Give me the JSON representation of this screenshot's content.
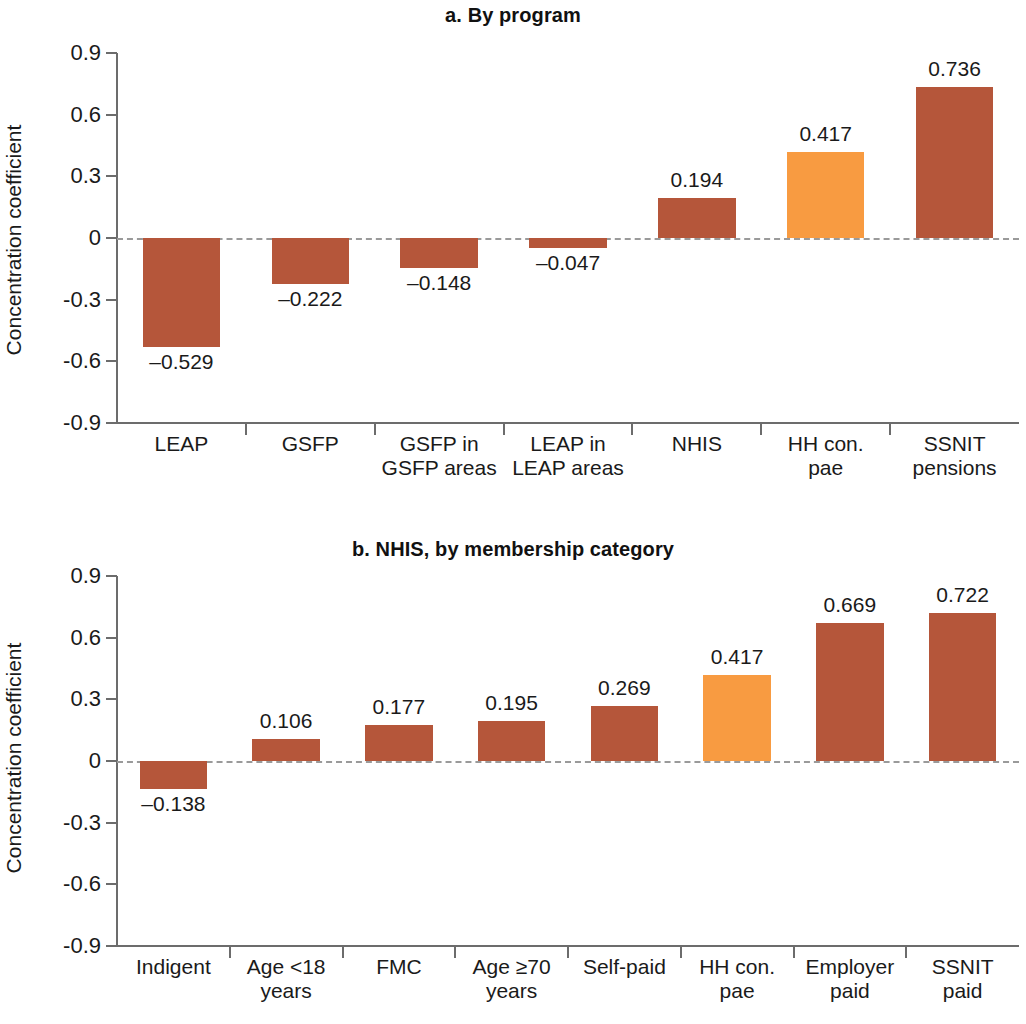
{
  "colors": {
    "bar_default": "#b5563a",
    "bar_highlight": "#f89b41",
    "axis": "#6c6c6c",
    "zero_line": "#9a9a9a",
    "text": "#1a1a1a"
  },
  "axis": {
    "y_label": "Concentration coefficient",
    "y_ticks": [
      "0.9",
      "0.6",
      "0.3",
      "0",
      "-0.3",
      "-0.6",
      "-0.9"
    ],
    "y_tick_values": [
      0.9,
      0.6,
      0.3,
      0,
      -0.3,
      -0.6,
      -0.9
    ],
    "y_min": -0.9,
    "y_max": 0.9
  },
  "chart_data": [
    {
      "type": "bar",
      "title": "a. By program",
      "xlabel": "",
      "ylabel": "Concentration coefficient",
      "ylim": [
        -0.9,
        0.9
      ],
      "yticks": [
        -0.9,
        -0.6,
        -0.3,
        0,
        0.3,
        0.6,
        0.9
      ],
      "grid": false,
      "legend": "none",
      "categories": [
        "LEAP",
        "GSFP",
        "GSFP in\nGSFP areas",
        "LEAP in\nLEAP areas",
        "NHIS",
        "HH con.\npae",
        "SSNIT\npensions"
      ],
      "values": [
        -0.529,
        -0.222,
        -0.148,
        -0.047,
        0.194,
        0.417,
        0.736
      ],
      "data_labels": [
        "–0.529",
        "–0.222",
        "–0.148",
        "–0.047",
        "0.194",
        "0.417",
        "0.736"
      ],
      "bar_colors": [
        "#b5563a",
        "#b5563a",
        "#b5563a",
        "#b5563a",
        "#b5563a",
        "#f89b41",
        "#b5563a"
      ]
    },
    {
      "type": "bar",
      "title": "b. NHIS, by membership category",
      "xlabel": "",
      "ylabel": "Concentration coefficient",
      "ylim": [
        -0.9,
        0.9
      ],
      "yticks": [
        -0.9,
        -0.6,
        -0.3,
        0,
        0.3,
        0.6,
        0.9
      ],
      "grid": false,
      "legend": "none",
      "categories": [
        "Indigent",
        "Age <18\nyears",
        "FMC",
        "Age ≥70\nyears",
        "Self-paid",
        "HH con.\npae",
        "Employer\npaid",
        "SSNIT\npaid"
      ],
      "values": [
        -0.138,
        0.106,
        0.177,
        0.195,
        0.269,
        0.417,
        0.669,
        0.722
      ],
      "data_labels": [
        "–0.138",
        "0.106",
        "0.177",
        "0.195",
        "0.269",
        "0.417",
        "0.669",
        "0.722"
      ],
      "bar_colors": [
        "#b5563a",
        "#b5563a",
        "#b5563a",
        "#b5563a",
        "#b5563a",
        "#f89b41",
        "#b5563a",
        "#b5563a"
      ]
    }
  ]
}
